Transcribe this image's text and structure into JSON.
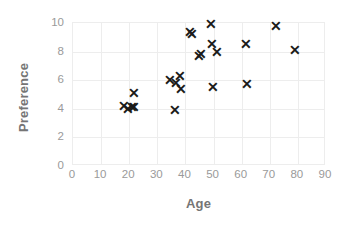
{
  "chart_data": {
    "type": "scatter",
    "title": "",
    "xlabel": "Age",
    "ylabel": "Preference",
    "xlim": [
      0,
      90
    ],
    "ylim": [
      0,
      10
    ],
    "xticks": [
      0,
      10,
      20,
      30,
      40,
      50,
      60,
      70,
      80,
      90
    ],
    "yticks": [
      0,
      2,
      4,
      6,
      8,
      10
    ],
    "grid": true,
    "legend": null,
    "marker": "x",
    "marker_color": "#1a1a1a",
    "grid_color": "#ededed",
    "tick_label_color": "#9a9a9a",
    "axis_title_color": "#757575",
    "background": "#ffffff",
    "series": [
      {
        "name": "Age vs Preference",
        "points": [
          {
            "x": 18.5,
            "y": 4.1
          },
          {
            "x": 20.0,
            "y": 3.9
          },
          {
            "x": 21.3,
            "y": 4.0
          },
          {
            "x": 22.0,
            "y": 4.0
          },
          {
            "x": 22.2,
            "y": 5.0
          },
          {
            "x": 36.5,
            "y": 3.8
          },
          {
            "x": 35.0,
            "y": 5.9
          },
          {
            "x": 37.0,
            "y": 5.7
          },
          {
            "x": 38.5,
            "y": 6.2
          },
          {
            "x": 38.8,
            "y": 5.3
          },
          {
            "x": 42.0,
            "y": 9.3
          },
          {
            "x": 42.8,
            "y": 9.1
          },
          {
            "x": 45.0,
            "y": 7.6
          },
          {
            "x": 46.0,
            "y": 7.7
          },
          {
            "x": 49.5,
            "y": 9.8
          },
          {
            "x": 49.8,
            "y": 8.4
          },
          {
            "x": 51.5,
            "y": 7.9
          },
          {
            "x": 50.0,
            "y": 5.4
          },
          {
            "x": 62.0,
            "y": 8.4
          },
          {
            "x": 62.3,
            "y": 5.6
          },
          {
            "x": 72.5,
            "y": 9.7
          },
          {
            "x": 79.5,
            "y": 8.0
          }
        ]
      }
    ]
  }
}
